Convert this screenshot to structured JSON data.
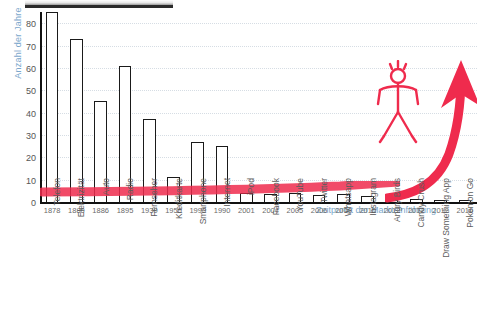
{
  "chart_data": {
    "type": "bar",
    "title": "",
    "xlabel": "Zeitpunkt der Markteinführung",
    "ylabel": "Anzahl der Jahre",
    "ylim": [
      0,
      85
    ],
    "yticks": [
      0,
      10,
      20,
      30,
      40,
      50,
      60,
      70,
      80
    ],
    "grid": true,
    "legend": false,
    "categories": [
      "Telefon",
      "Elektrizität",
      "Auto",
      "Radio",
      "Fernseher",
      "Kreditkarte",
      "Smartphone",
      "Internet",
      "iPod",
      "Facebook",
      "YouTube",
      "Twitter",
      "Whatsapp",
      "Instagram",
      "Angry Birds",
      "Candy Crush",
      "Draw Something App",
      "Pokemon Go"
    ],
    "years": [
      "1878",
      "1880",
      "1886",
      "1895",
      "1930",
      "1950",
      "1990",
      "1990",
      "2001",
      "2004",
      "2005",
      "2006",
      "2009",
      "2010",
      "2012",
      "2012",
      "2012",
      "2016"
    ],
    "values": [
      85,
      73,
      45,
      61,
      37,
      11,
      27,
      25,
      4,
      3.5,
      4,
      3,
      3.5,
      2.5,
      1.5,
      1.2,
      0.8,
      0.6
    ],
    "annotations": [
      {
        "name": "red-trend-arrow",
        "color": "#ef2b4d",
        "description": "rote Trendkurve mit Pfeil nach oben"
      },
      {
        "name": "red-stick-figure",
        "color": "#ef2b4d",
        "description": "rote Strichmännchen-Figur"
      }
    ],
    "colors": {
      "bar_outline": "#1a1a1a",
      "bar_fill": "#ffffff",
      "accent_blue": "#7ba7cc",
      "accent_red": "#ef2b4d",
      "grid": "#d6dde4"
    }
  }
}
